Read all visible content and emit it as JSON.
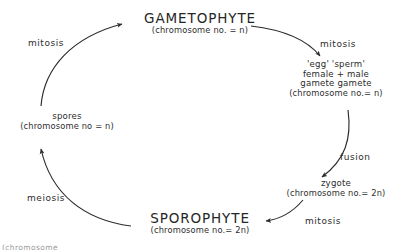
{
  "diagram": {
    "type": "life-cycle",
    "title_visible": false,
    "ink_color": "#2b2b2b",
    "background_color": "#ffffff",
    "nodes": [
      {
        "id": "gametophyte",
        "label": "GAMETOPHYTE",
        "sublabel": "(chromosome no. = n)",
        "ploidy": "n"
      },
      {
        "id": "gametes",
        "line1": "'egg'    'sperm'",
        "line2": "female + male",
        "line3": "gamete   gamete",
        "sublabel": "(chromosome no.= n)",
        "ploidy": "n"
      },
      {
        "id": "zygote",
        "label": "zygote",
        "sublabel": "(chromosome no.= 2n)",
        "ploidy": "2n"
      },
      {
        "id": "sporophyte",
        "label": "SPOROPHYTE",
        "sublabel": "(chromosome no.= 2n)",
        "ploidy": "2n"
      },
      {
        "id": "spores",
        "label": "spores",
        "sublabel": "(chromosome no = n)",
        "ploidy": "n"
      }
    ],
    "processes": [
      {
        "id": "mitosis-spores-to-gametophyte",
        "label": "mitosis",
        "from": "spores",
        "to": "gametophyte"
      },
      {
        "id": "mitosis-gametophyte-to-gametes",
        "label": "mitosis",
        "from": "gametophyte",
        "to": "gametes"
      },
      {
        "id": "fusion-gametes-to-zygote",
        "label": "fusion",
        "from": "gametes",
        "to": "zygote"
      },
      {
        "id": "mitosis-zygote-to-sporophyte",
        "label": "mitosis",
        "from": "zygote",
        "to": "sporophyte"
      },
      {
        "id": "meiosis-sporophyte-to-spores",
        "label": "meiosis",
        "from": "sporophyte",
        "to": "spores"
      }
    ],
    "cut_off_text": "(chromosome"
  }
}
